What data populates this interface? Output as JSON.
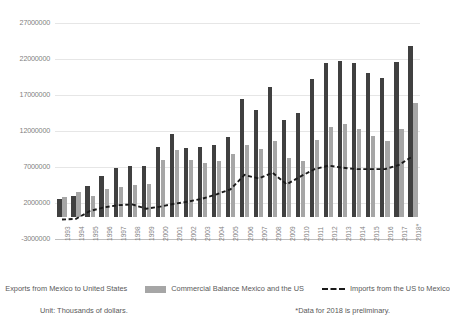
{
  "chart_data": {
    "type": "bar",
    "title": "",
    "xlabel": "",
    "ylabel": "",
    "grid": true,
    "legend_position": "bottom",
    "ylim": [
      -3000000,
      27000000
    ],
    "yticks": [
      27000000,
      22000000,
      17000000,
      12000000,
      7000000,
      2000000,
      -3000000
    ],
    "ytick_labels": [
      "27000000",
      "22000000",
      "17000000",
      "12000000",
      "7000000",
      "2000000",
      "-3000000"
    ],
    "categories": [
      "1993",
      "1994",
      "1995",
      "1996",
      "1997",
      "1998",
      "1999",
      "2000",
      "2001",
      "2002",
      "2003",
      "2004",
      "2005",
      "2006",
      "2007",
      "2008",
      "2009",
      "2010",
      "2011",
      "2012",
      "2013",
      "2014",
      "2015",
      "2016",
      "2017",
      "2018*"
    ],
    "series": [
      {
        "name": "Exports from Mexico to United States",
        "type": "bar",
        "color": "#404040",
        "values": [
          2600000,
          3000000,
          4300000,
          5800000,
          6900000,
          7100000,
          7200000,
          9800000,
          11600000,
          9700000,
          9800000,
          10000000,
          11200000,
          16500000,
          14900000,
          18100000,
          13500000,
          14500000,
          19200000,
          21400000,
          21700000,
          21500000,
          20100000,
          19400000,
          21600000,
          23800000
        ]
      },
      {
        "name": "Commercial Balance Mexico and the US",
        "type": "bar",
        "color": "#a6a6a6",
        "values": [
          2900000,
          3500000,
          3000000,
          4000000,
          4200000,
          4500000,
          4700000,
          8000000,
          9300000,
          8000000,
          7600000,
          7800000,
          8800000,
          10100000,
          9500000,
          10600000,
          8200000,
          7900000,
          10700000,
          12500000,
          13000000,
          12300000,
          11300000,
          10600000,
          12300000,
          15900000
        ]
      },
      {
        "name": "Imports from the US to Mexico",
        "type": "line",
        "style": "dashed",
        "color": "#1a1a1a",
        "values": [
          -300000,
          -200000,
          900000,
          1400000,
          1700000,
          1800000,
          1200000,
          1500000,
          1900000,
          2200000,
          2600000,
          3200000,
          3900000,
          5900000,
          5400000,
          6200000,
          4600000,
          5700000,
          6700000,
          7200000,
          6900000,
          6700000,
          6700000,
          6700000,
          7300000,
          8500000
        ]
      }
    ]
  },
  "legend": {
    "items": [
      {
        "label": "Exports from Mexico to United States",
        "marker": "dark-bar-swatch"
      },
      {
        "label": "Commercial Balance Mexico and the US",
        "marker": "light-bar-swatch"
      },
      {
        "label": "Imports from the US to Mexico",
        "marker": "dashed-line-swatch"
      }
    ]
  },
  "footer": {
    "unit_note": "Unit: Thousands of dollars.",
    "preliminary_note": "*Data for 2018 is preliminary."
  },
  "colors": {
    "exports_bar": "#404040",
    "balance_bar": "#a6a6a6",
    "imports_line": "#1a1a1a",
    "gridline": "#e6e6e6",
    "axis_text": "#7f7f7f"
  }
}
